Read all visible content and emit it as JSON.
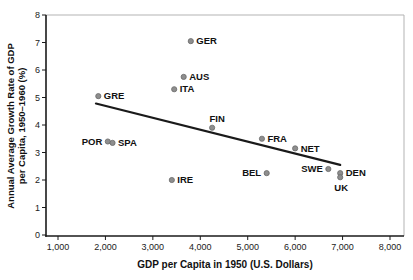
{
  "figure": {
    "background": "#ffffff",
    "border_color": "#b3b3b3",
    "axis_color": "#1a1a1a",
    "point_color": "#8e8e8e",
    "point_edge_color": "#6a6a6a",
    "trend_color": "#1a1a1a"
  },
  "chart_data": {
    "type": "scatter",
    "title": "",
    "xlabel": "GDP per Capita in 1950 (U.S. Dollars)",
    "ylabel_line1": "Annual Average Growth Rate of GDP",
    "ylabel_line2": "per Capita, 1950–1960 (%)",
    "xlim": [
      1000,
      8000
    ],
    "ylim": [
      0,
      8
    ],
    "grid": "off",
    "legend": "none",
    "x_ticks": [
      {
        "value": 1000,
        "label": "1,000"
      },
      {
        "value": 2000,
        "label": "2,000"
      },
      {
        "value": 3000,
        "label": "3,000"
      },
      {
        "value": 4000,
        "label": "4,000"
      },
      {
        "value": 5000,
        "label": "5,000"
      },
      {
        "value": 6000,
        "label": "6,000"
      },
      {
        "value": 7000,
        "label": "7,000"
      },
      {
        "value": 8000,
        "label": "8,000"
      }
    ],
    "y_ticks": [
      {
        "value": 0,
        "label": "0"
      },
      {
        "value": 1,
        "label": "1"
      },
      {
        "value": 2,
        "label": "2"
      },
      {
        "value": 3,
        "label": "3"
      },
      {
        "value": 4,
        "label": "4"
      },
      {
        "value": 5,
        "label": "5"
      },
      {
        "value": 6,
        "label": "6"
      },
      {
        "value": 7,
        "label": "7"
      },
      {
        "value": 8,
        "label": "8"
      }
    ],
    "points": [
      {
        "label": "GRE",
        "x": 1850,
        "y": 5.05,
        "side": "right"
      },
      {
        "label": "POR",
        "x": 2050,
        "y": 3.4,
        "side": "left"
      },
      {
        "label": "SPA",
        "x": 2150,
        "y": 3.35,
        "side": "right"
      },
      {
        "label": "IRE",
        "x": 3400,
        "y": 2.0,
        "side": "right"
      },
      {
        "label": "ITA",
        "x": 3450,
        "y": 5.3,
        "side": "right"
      },
      {
        "label": "AUS",
        "x": 3650,
        "y": 5.75,
        "side": "right"
      },
      {
        "label": "GER",
        "x": 3800,
        "y": 7.05,
        "side": "right"
      },
      {
        "label": "FIN",
        "x": 4250,
        "y": 3.9,
        "side": "above"
      },
      {
        "label": "FRA",
        "x": 5300,
        "y": 3.5,
        "side": "right"
      },
      {
        "label": "BEL",
        "x": 5400,
        "y": 2.25,
        "side": "left"
      },
      {
        "label": "NET",
        "x": 6000,
        "y": 3.15,
        "side": "right"
      },
      {
        "label": "SWE",
        "x": 6700,
        "y": 2.4,
        "side": "left"
      },
      {
        "label": "DEN",
        "x": 6950,
        "y": 2.25,
        "side": "right"
      },
      {
        "label": "UK",
        "x": 6950,
        "y": 2.1,
        "side": "below"
      }
    ],
    "trend_line": {
      "x1": 1800,
      "y1": 4.78,
      "x2": 6950,
      "y2": 2.55
    }
  }
}
